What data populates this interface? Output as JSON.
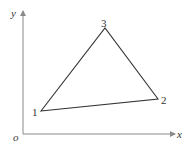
{
  "diagram": {
    "axes": {
      "x_label": "x",
      "y_label": "y",
      "origin_label": "o",
      "color": "#8a8a8a"
    },
    "triangle": {
      "color": "#333333",
      "vertices": [
        {
          "id": "1",
          "label": "1"
        },
        {
          "id": "2",
          "label": "2"
        },
        {
          "id": "3",
          "label": "3"
        }
      ]
    }
  }
}
